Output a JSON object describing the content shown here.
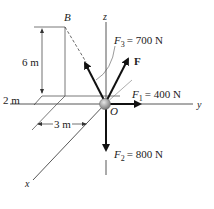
{
  "diagram": {
    "point_B": "B",
    "origin": "O",
    "axes": {
      "x": "x",
      "y": "y",
      "z": "z"
    },
    "dimensions": {
      "height": "6 m",
      "depth": "2 m",
      "width": "3 m"
    },
    "forces": {
      "F1": {
        "symbol": "F",
        "sub": "1",
        "value": "= 400 N"
      },
      "F2": {
        "symbol": "F",
        "sub": "2",
        "value": "= 800 N"
      },
      "F3": {
        "symbol": "F",
        "sub": "3",
        "value": "= 700 N"
      },
      "F": {
        "symbol": "F"
      }
    },
    "colors": {
      "line": "#222222",
      "thin": "#555555",
      "ball": "#9a9a9a"
    }
  }
}
